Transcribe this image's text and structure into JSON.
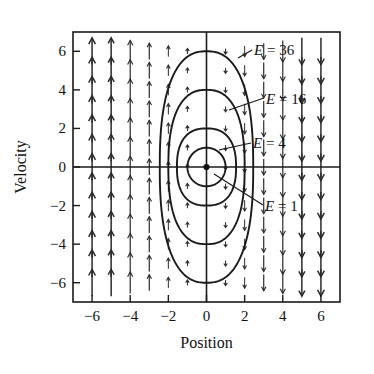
{
  "figure": {
    "type": "phase-portrait",
    "background_color": "#ffffff",
    "ink_color": "#1a1a1a"
  },
  "axes": {
    "x_title": "Position",
    "y_title": "Velocity",
    "x_ticks": [
      "−6",
      "−4",
      "−2",
      "0",
      "2",
      "4",
      "6"
    ],
    "y_ticks": [
      "6",
      "4",
      "2",
      "0",
      "−2",
      "−4",
      "−6"
    ],
    "x_tick_values": [
      -6,
      -4,
      -2,
      0,
      2,
      4,
      6
    ],
    "y_tick_values": [
      6,
      4,
      2,
      0,
      -2,
      -4,
      -6
    ],
    "xlim": [
      -7,
      7
    ],
    "ylim": [
      -7,
      7
    ],
    "frame": true,
    "grid": false
  },
  "annotations": [
    {
      "id": "e36",
      "text": "E = 36",
      "energy": 36
    },
    {
      "id": "e16",
      "text": "E = 16",
      "energy": 16
    },
    {
      "id": "e4",
      "text": "E = 4",
      "energy": 4
    },
    {
      "id": "e1",
      "text": "E = 1",
      "energy": 1
    }
  ],
  "chart_data": {
    "type": "line",
    "title": "",
    "xlabel": "Position",
    "ylabel": "Velocity",
    "xlim": [
      -7,
      7
    ],
    "ylim": [
      -7,
      7
    ],
    "grid": false,
    "legend_position": "inline-annotations",
    "contours": [
      {
        "name": "E = 1",
        "energy": 1,
        "x_half_width": 1.0,
        "y_half_height": 1.0
      },
      {
        "name": "E = 4",
        "energy": 4,
        "x_half_width": 1.55,
        "y_half_height": 2.0
      },
      {
        "name": "E = 16",
        "energy": 16,
        "x_half_width": 2.0,
        "y_half_height": 4.0
      },
      {
        "name": "E = 36",
        "energy": 36,
        "x_half_width": 2.45,
        "y_half_height": 6.0
      }
    ],
    "vector_field": {
      "description": "Arrows are vertical; direction is up for x<0 and down for x>0; length proportional to |x|.",
      "x_samples": [
        -6,
        -5,
        -4,
        -3,
        -2,
        -1,
        0,
        1,
        2,
        3,
        4,
        5,
        6
      ],
      "y_samples": [
        6,
        5,
        4,
        3,
        2,
        1,
        0,
        -1,
        -2,
        -3,
        -4,
        -5,
        -6
      ],
      "dx": 0,
      "dy_rule": "-x"
    },
    "equilibrium_point": {
      "x": 0,
      "y": 0,
      "marker": "filled-dot"
    }
  }
}
